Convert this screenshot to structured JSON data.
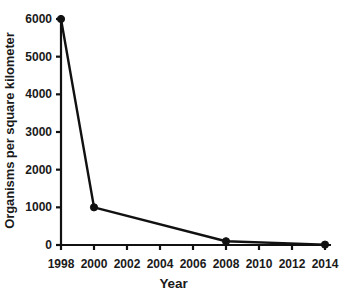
{
  "chart_data": {
    "type": "line",
    "title": "",
    "xlabel": "Year",
    "ylabel": "Organisms per square kilometer",
    "x": [
      1998,
      2000,
      2008,
      2014
    ],
    "values": [
      6000,
      1000,
      100,
      10
    ],
    "series": [
      {
        "name": "Organisms per square kilometer",
        "values": [
          6000,
          1000,
          100,
          10
        ]
      }
    ],
    "xlim": [
      1998,
      2014
    ],
    "ylim": [
      0,
      6000
    ],
    "xticks": [
      1998,
      2000,
      2002,
      2004,
      2006,
      2008,
      2010,
      2012,
      2014
    ],
    "yticks": [
      0,
      1000,
      2000,
      3000,
      4000,
      5000,
      6000
    ],
    "xtick_labels": [
      "1998",
      "2000",
      "2002",
      "2004",
      "2006",
      "2008",
      "2010",
      "2012",
      "2014"
    ],
    "ytick_labels": [
      "0",
      "1000",
      "2000",
      "3000",
      "4000",
      "5000",
      "6000"
    ],
    "grid": false,
    "legend": "none",
    "colors": {
      "line": "#111111",
      "marker": "#111111",
      "axis": "#111111",
      "text": "#1a1a1a",
      "background": "#ffffff"
    },
    "marker": "filled-circle",
    "annotations": []
  }
}
